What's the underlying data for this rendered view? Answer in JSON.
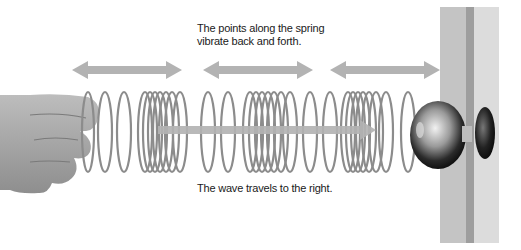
{
  "diagram": {
    "annotations": {
      "top_line1": "The points along the spring",
      "top_line2": "vibrate back and forth.",
      "bottom": "The wave travels to the right."
    },
    "arrows": {
      "oscillation": [
        {
          "x1": 72,
          "x2": 182,
          "y": 70
        },
        {
          "x1": 203,
          "x2": 313,
          "y": 70
        },
        {
          "x1": 330,
          "x2": 440,
          "y": 70
        }
      ],
      "propagation": {
        "x1": 158,
        "x2": 375,
        "y": 130
      }
    },
    "spring_coils_x": [
      88,
      105,
      124,
      145,
      150,
      155,
      160,
      166,
      172,
      180,
      208,
      228,
      250,
      256,
      262,
      268,
      274,
      281,
      290,
      310,
      330,
      348,
      353,
      358,
      363,
      369,
      376,
      386,
      408
    ],
    "colors": {
      "arrow": "#b3b3b3",
      "spring": "#8c8c8c",
      "door": "#c9c9c9",
      "door_edge": "#9f9f9f",
      "text": "#1a1a1a"
    },
    "objects": [
      "hand",
      "spring",
      "doorknob",
      "door"
    ]
  }
}
